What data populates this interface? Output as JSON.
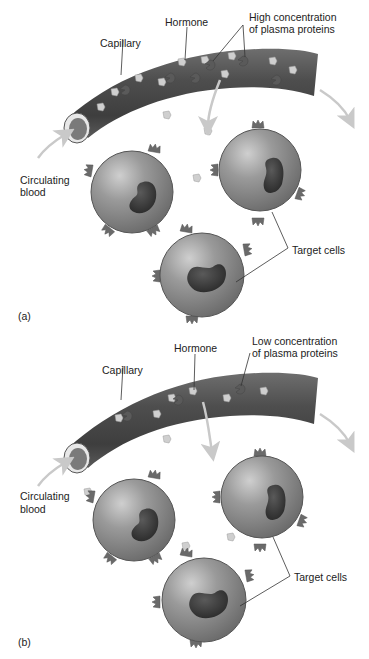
{
  "figure": {
    "panels": [
      {
        "id": "a",
        "panel_label": "(a)",
        "labels": {
          "capillary": "Capillary",
          "hormone": "Hormone",
          "proteins_line1": "High concentration",
          "proteins_line2": "of plasma proteins",
          "circulating_line1": "Circulating",
          "circulating_line2": "blood",
          "target_cells": "Target cells"
        }
      },
      {
        "id": "b",
        "panel_label": "(b)",
        "labels": {
          "capillary": "Capillary",
          "hormone": "Hormone",
          "proteins_line1": "Low concentration",
          "proteins_line2": "of plasma proteins",
          "circulating_line1": "Circulating",
          "circulating_line2": "blood",
          "target_cells": "Target cells"
        }
      }
    ],
    "colors": {
      "capillary": "#555555",
      "cell": "#8f8f8f",
      "nucleus": "#3a3a3a",
      "hormone": "#c8c8c8",
      "protein": "#5a5a5a",
      "arrow": "#c9c9c9",
      "leader": "#333333"
    }
  }
}
